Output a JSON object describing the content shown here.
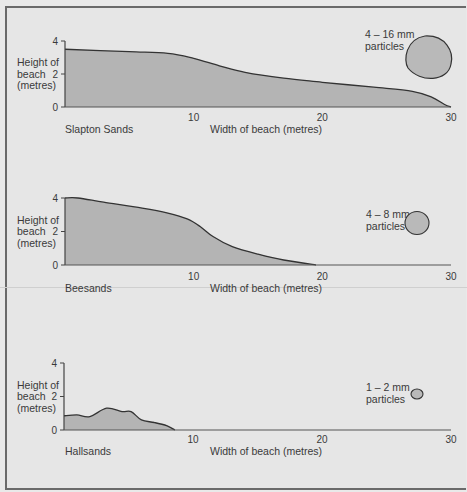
{
  "colors": {
    "background": "#e6e6e6",
    "fill": "#b4b4b4",
    "line": "#333333",
    "particle_fill": "#b9b9b9"
  },
  "common": {
    "y_label_lines": [
      "Height of",
      "beach",
      "(metres)"
    ],
    "x_label": "Width of beach (metres)",
    "y_ticks": [
      "4",
      "2",
      "0"
    ],
    "x_ticks": [
      "10",
      "20",
      "30"
    ]
  },
  "charts": [
    {
      "name": "Slapton Sands",
      "particle_label_1": "4 – 16 mm",
      "particle_label_2": "particles"
    },
    {
      "name": "Beesands",
      "particle_label_1": "4 – 8 mm",
      "particle_label_2": "particles"
    },
    {
      "name": "Hallsands",
      "particle_label_1": "1 – 2 mm",
      "particle_label_2": "particles"
    }
  ],
  "chart_data": [
    {
      "type": "area",
      "title": "Slapton Sands",
      "xlabel": "Width of beach (metres)",
      "ylabel": "Height of beach (metres)",
      "xlim": [
        0,
        30
      ],
      "ylim": [
        0,
        4
      ],
      "x_ticks": [
        10,
        20,
        30
      ],
      "y_ticks": [
        0,
        2,
        4
      ],
      "grid": false,
      "annotation": "4 – 16 mm particles",
      "x": [
        0,
        5,
        8,
        10,
        12,
        14,
        17,
        20,
        24,
        27,
        28.5,
        29.5,
        30
      ],
      "values": [
        3.5,
        3.35,
        3.25,
        2.95,
        2.5,
        2.1,
        1.75,
        1.5,
        1.2,
        0.95,
        0.6,
        0.15,
        0
      ]
    },
    {
      "type": "area",
      "title": "Beesands",
      "xlabel": "Width of beach (metres)",
      "ylabel": "Height of beach (metres)",
      "xlim": [
        0,
        30
      ],
      "ylim": [
        0,
        4
      ],
      "x_ticks": [
        10,
        20,
        30
      ],
      "y_ticks": [
        0,
        2,
        4
      ],
      "grid": false,
      "annotation": "4 – 8 mm particles",
      "x": [
        0,
        1,
        3,
        6,
        8,
        9.5,
        10.5,
        11.5,
        13,
        15,
        17,
        19.5
      ],
      "values": [
        4.0,
        4.0,
        3.75,
        3.4,
        3.1,
        2.75,
        2.3,
        1.7,
        1.1,
        0.65,
        0.3,
        0
      ]
    },
    {
      "type": "area",
      "title": "Hallsands",
      "xlabel": "Width of beach (metres)",
      "ylabel": "Height of beach (metres)",
      "xlim": [
        0,
        30
      ],
      "ylim": [
        0,
        4
      ],
      "x_ticks": [
        10,
        20,
        30
      ],
      "y_ticks": [
        0,
        2,
        4
      ],
      "grid": false,
      "annotation": "1 – 2 mm particles",
      "x": [
        0,
        1,
        2,
        3.3,
        4.5,
        5.2,
        6,
        7,
        8,
        8.6
      ],
      "values": [
        0.85,
        0.9,
        0.8,
        1.3,
        1.1,
        1.1,
        0.6,
        0.45,
        0.25,
        0
      ]
    }
  ]
}
